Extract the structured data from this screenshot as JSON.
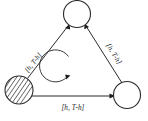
{
  "figure": {
    "title": "",
    "type": "state-transition-cycle-diagram",
    "background_color": "#ffffff",
    "line_color": "#2b2b2b"
  },
  "nodes": [
    {
      "id": "node-top",
      "label": "",
      "fill_style": "empty",
      "position": "top"
    },
    {
      "id": "node-bottom-left",
      "label": "",
      "fill_style": "hatched",
      "position": "bottom-left"
    },
    {
      "id": "node-bottom-right",
      "label": "",
      "fill_style": "empty",
      "position": "bottom-right"
    }
  ],
  "edges": [
    {
      "id": "edge-left",
      "from": "node-bottom-left",
      "to": "node-top",
      "label": "[h, T-h]",
      "direction": "up-right"
    },
    {
      "id": "edge-right",
      "from": "node-bottom-right",
      "to": "node-top",
      "label": "[h, T-h]",
      "direction": "up-left"
    },
    {
      "id": "edge-bottom",
      "from": "node-bottom-left",
      "to": "node-bottom-right",
      "label": "[h, T-h]",
      "direction": "right"
    }
  ],
  "center_cycle": {
    "id": "cycle-arrow",
    "label": "",
    "rotation": "counterclockwise"
  }
}
